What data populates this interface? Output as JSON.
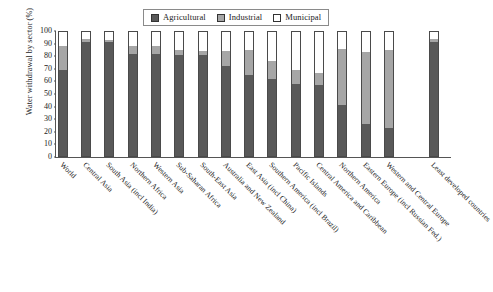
{
  "chart_data": {
    "type": "bar",
    "subtype": "stacked-percentage",
    "title": "",
    "xlabel": "",
    "ylabel": "Water withdrawal by sector (%)",
    "ylim": [
      0,
      100
    ],
    "yticks": [
      0,
      10,
      20,
      30,
      40,
      50,
      60,
      70,
      80,
      90,
      100
    ],
    "grid": false,
    "legend_position": "top-center",
    "categories": [
      "World",
      "Central Asia",
      "South Asia (incl India)",
      "Northern Africa",
      "Western Asia",
      "Sub-Saharan Africa",
      "South-East Asia",
      "Australia and New Zealand",
      "East Asia (incl China)",
      "Southern America (incl Brazil)",
      "Pacific Islands",
      "Central America and Caribbean",
      "Northern America",
      "Eastern Europe (incl Russian Fed.)",
      "Western and Central Europe",
      "Least developed countries"
    ],
    "series": [
      {
        "name": "Agricultural",
        "color": "#595959",
        "values": [
          69,
          91,
          91,
          82,
          82,
          81,
          81,
          72,
          65,
          62,
          58,
          57,
          41,
          26,
          23,
          91
        ]
      },
      {
        "name": "Industrial",
        "color": "#a6a6a6",
        "values": [
          19,
          3,
          2,
          6,
          6,
          4,
          3,
          12,
          20,
          14,
          11,
          10,
          45,
          57,
          62,
          3
        ]
      },
      {
        "name": "Municipal",
        "color": "#ffffff",
        "values": [
          12,
          6,
          7,
          12,
          12,
          15,
          16,
          16,
          15,
          24,
          31,
          33,
          14,
          17,
          15,
          6
        ]
      }
    ]
  },
  "legend": {
    "entries": [
      {
        "label": "Agricultural",
        "color": "#595959"
      },
      {
        "label": "Industrial",
        "color": "#a6a6a6"
      },
      {
        "label": "Municipal",
        "color": "#ffffff"
      }
    ]
  },
  "axes": {
    "y_title": "Water withdrawal by sector (%)",
    "y_tick_labels": [
      "100",
      "90",
      "80",
      "70",
      "60",
      "50",
      "40",
      "30",
      "20",
      "10",
      "0"
    ]
  }
}
